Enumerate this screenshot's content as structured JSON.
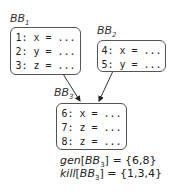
{
  "blocks": [
    {
      "id": "BB1",
      "name": "BB",
      "sub": "1",
      "lines": [
        "1: x = ...",
        "2: y = ...",
        "3: z = ..."
      ]
    },
    {
      "id": "BB2",
      "name": "BB",
      "sub": "2",
      "lines": [
        "4: x = ...",
        "5: y = ..."
      ]
    },
    {
      "id": "BB3",
      "name": "BB",
      "sub": "3",
      "lines": [
        "6: x = ...",
        "7: z = ...",
        "8: z = ..."
      ]
    }
  ],
  "edges": [
    {
      "from": "BB1",
      "to": "BB3"
    },
    {
      "from": "BB2",
      "to": "BB3"
    }
  ],
  "equations": {
    "gen": {
      "fn": "gen",
      "bb": "BB",
      "sub": "3",
      "value": "= {6,8}"
    },
    "kill": {
      "fn": "kill",
      "bb": "BB",
      "sub": "3",
      "value": "= {1,3,4}"
    }
  },
  "colors": {
    "stroke": "#555555",
    "arrow": "#333333"
  }
}
